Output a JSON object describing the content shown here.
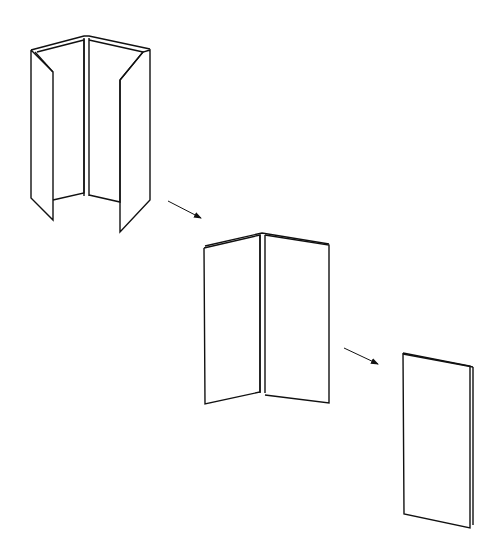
{
  "diagram": {
    "title": "",
    "stroke_color": "#111111",
    "background": "#ffffff",
    "steps": [
      {
        "id": "step-1-open-gatefold",
        "label": "",
        "polylines": [
          {
            "name": "left-outer-flap",
            "points": [
              [
                31,
                50
              ],
              [
                53,
                72
              ],
              [
                53,
                220
              ],
              [
                31,
                198
              ],
              [
                31,
                50
              ]
            ]
          },
          {
            "name": "left-flap-fold-inner",
            "points": [
              [
                35,
                52
              ],
              [
                53,
                72
              ]
            ]
          },
          {
            "name": "left-inner-panel",
            "points": [
              [
                37,
                52
              ],
              [
                84,
                40
              ],
              [
                84,
                193
              ],
              [
                53,
                200
              ]
            ]
          },
          {
            "name": "center-spine-left",
            "points": [
              [
                84,
                38
              ],
              [
                84,
                196
              ]
            ]
          },
          {
            "name": "center-spine-right",
            "points": [
              [
                89,
                38
              ],
              [
                89,
                196
              ]
            ]
          },
          {
            "name": "right-inner-panel",
            "points": [
              [
                89,
                40
              ],
              [
                143,
                52
              ],
              [
                120,
                80
              ],
              [
                120,
                202
              ],
              [
                89,
                195
              ]
            ]
          },
          {
            "name": "right-outer-flap",
            "points": [
              [
                120,
                80
              ],
              [
                143,
                52
              ],
              [
                150,
                50
              ],
              [
                150,
                200
              ],
              [
                120,
                232
              ],
              [
                120,
                80
              ]
            ]
          },
          {
            "name": "top-edge",
            "points": [
              [
                31,
                50
              ],
              [
                84,
                36
              ],
              [
                89,
                36
              ],
              [
                150,
                49
              ]
            ]
          }
        ]
      },
      {
        "id": "step-2-bifold",
        "label": "",
        "polylines": [
          {
            "name": "left-panel",
            "points": [
              [
                204,
                248
              ],
              [
                260,
                235
              ],
              [
                260,
                392
              ],
              [
                205,
                404
              ],
              [
                204,
                248
              ]
            ]
          },
          {
            "name": "spine-left",
            "points": [
              [
                260,
                235
              ],
              [
                260,
                393
              ]
            ]
          },
          {
            "name": "spine-right",
            "points": [
              [
                265,
                235
              ],
              [
                265,
                393
              ]
            ]
          },
          {
            "name": "right-panel",
            "points": [
              [
                265,
                235
              ],
              [
                329,
                245
              ],
              [
                329,
                403
              ],
              [
                265,
                395
              ]
            ]
          },
          {
            "name": "top-edge-double",
            "points": [
              [
                205,
                246
              ],
              [
                262,
                233
              ],
              [
                329,
                244
              ]
            ]
          }
        ]
      },
      {
        "id": "step-3-folded",
        "label": "",
        "polylines": [
          {
            "name": "front-panel",
            "points": [
              [
                403,
                353
              ],
              [
                470,
                366
              ],
              [
                470,
                528
              ],
              [
                404,
                514
              ],
              [
                403,
                353
              ]
            ]
          },
          {
            "name": "back-edge-right",
            "points": [
              [
                473,
                367
              ],
              [
                473,
                525
              ]
            ]
          },
          {
            "name": "top-edge-double",
            "points": [
              [
                403,
                354
              ],
              [
                473,
                367
              ]
            ]
          }
        ]
      }
    ],
    "arrows": [
      {
        "name": "arrow-step1-to-step2",
        "from": [
          168,
          201
        ],
        "to": [
          201,
          218
        ]
      },
      {
        "name": "arrow-step2-to-step3",
        "from": [
          344,
          348
        ],
        "to": [
          378,
          364
        ]
      }
    ]
  }
}
